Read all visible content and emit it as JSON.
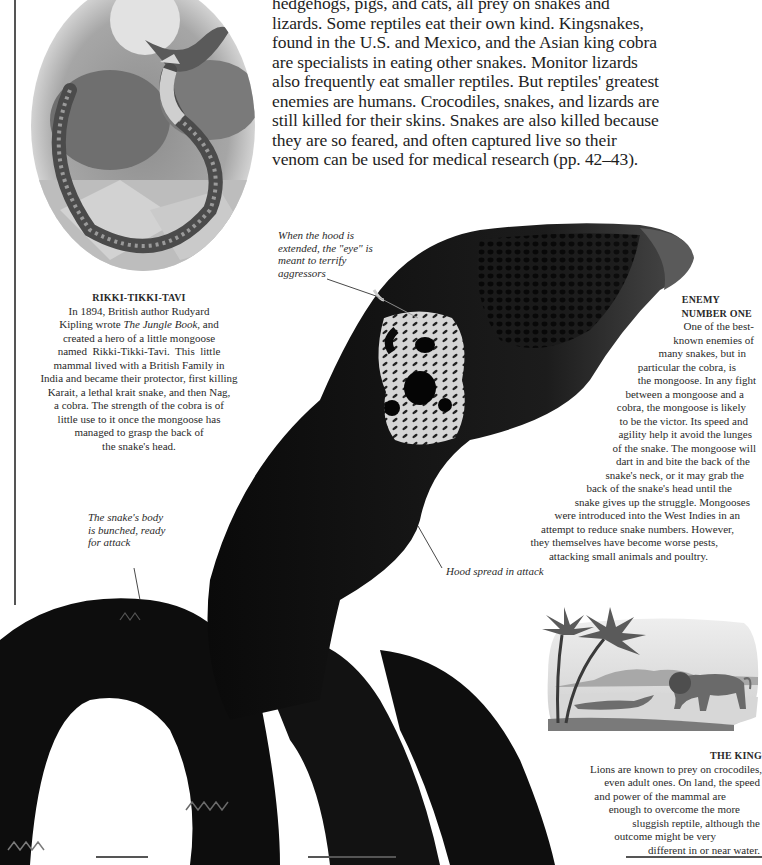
{
  "intro_text": {
    "lines": [
      "hedgehogs, pigs, and cats, all prey on snakes and",
      "lizards. Some reptiles eat their own kind. Kingsnakes,",
      "found in the U.S. and Mexico, and the Asian king cobra",
      "are specialists in eating other snakes. Monitor lizards",
      "also frequently eat smaller reptiles. But reptiles' greatest",
      "enemies are humans. Crocodiles, snakes, and lizards are",
      "still killed for their skins. Snakes are also killed because",
      "they are so feared, and often captured live so their",
      "venom can be used for medical research (pp. 42–43)."
    ]
  },
  "rikki_tikki_tavi": {
    "title": "RIKKI-TIKKI-TAVI",
    "lines": [
      "In 1894, British author Rudyard",
      "Kipling wrote The Jungle Book, and",
      "created a hero of a little mongoose",
      "named  Rikki-Tikki-Tavi.  This  little",
      "mammal lived with a British Family in",
      "India and became their protector, first killing",
      "Karait, a lethal krait snake, and then Nag,",
      "a cobra. The strength of the cobra is of",
      "little use to it once the mongoose has",
      "managed to grasp the back of",
      "the snake's head."
    ],
    "book_title": "The Jungle Book",
    "line2_pre": "Kipling wrote ",
    "line2_post": ", and"
  },
  "enemy_number_one": {
    "title_line1": "ENEMY",
    "title_line2": "NUMBER ONE",
    "lines": [
      "One of the best-",
      "known enemies of",
      "many snakes, but in",
      "particular the cobra, is",
      "the mongoose. In any fight",
      "between a mongoose and a",
      "cobra, the mongoose is likely",
      "to be the victor. Its speed and",
      "agility help it avoid the lunges",
      "of the snake. The mongoose will",
      "dart in and bite the back of the",
      "snake's neck, or it may grab the",
      "back of the snake's head until the",
      "snake gives up the struggle. Mongooses",
      "were introduced into the West Indies in an",
      "attempt to reduce snake numbers. However,",
      "they themselves have become worse pests,",
      "attacking small animals and poultry."
    ],
    "indents": [
      118,
      112,
      100,
      80,
      64,
      58,
      52,
      38,
      26,
      22,
      20,
      34,
      40,
      52,
      70,
      90,
      108,
      112
    ]
  },
  "the_king": {
    "title": "THE KING",
    "lines": [
      "Lions are known to prey on crocodiles,",
      "even adult ones. On land, the speed",
      "and power of the mammal are",
      "enough to overcome the more",
      "sluggish reptile, although the",
      "outcome might be very",
      "different in or near water."
    ],
    "right_pad": [
      0,
      2,
      36,
      22,
      2,
      46,
      2
    ]
  },
  "annotations": {
    "eye": [
      "When the hood is",
      "extended, the \"eye\" is",
      "meant to terrify",
      "aggressors"
    ],
    "body": [
      "The snake's body",
      "is bunched, ready",
      "for attack"
    ],
    "hood": "Hood spread in attack"
  },
  "illustrations": {
    "oval_painting": "mongoose-fighting-cobra-painting",
    "cobra_photo": "black-cobra-with-spread-hood",
    "engraving": "lion-and-crocodile-engraving"
  },
  "colors": {
    "text": "#1e1e1e",
    "snake": "#0b0b0b",
    "hood_pattern": "#d9d9d9",
    "rule": "#555555"
  }
}
